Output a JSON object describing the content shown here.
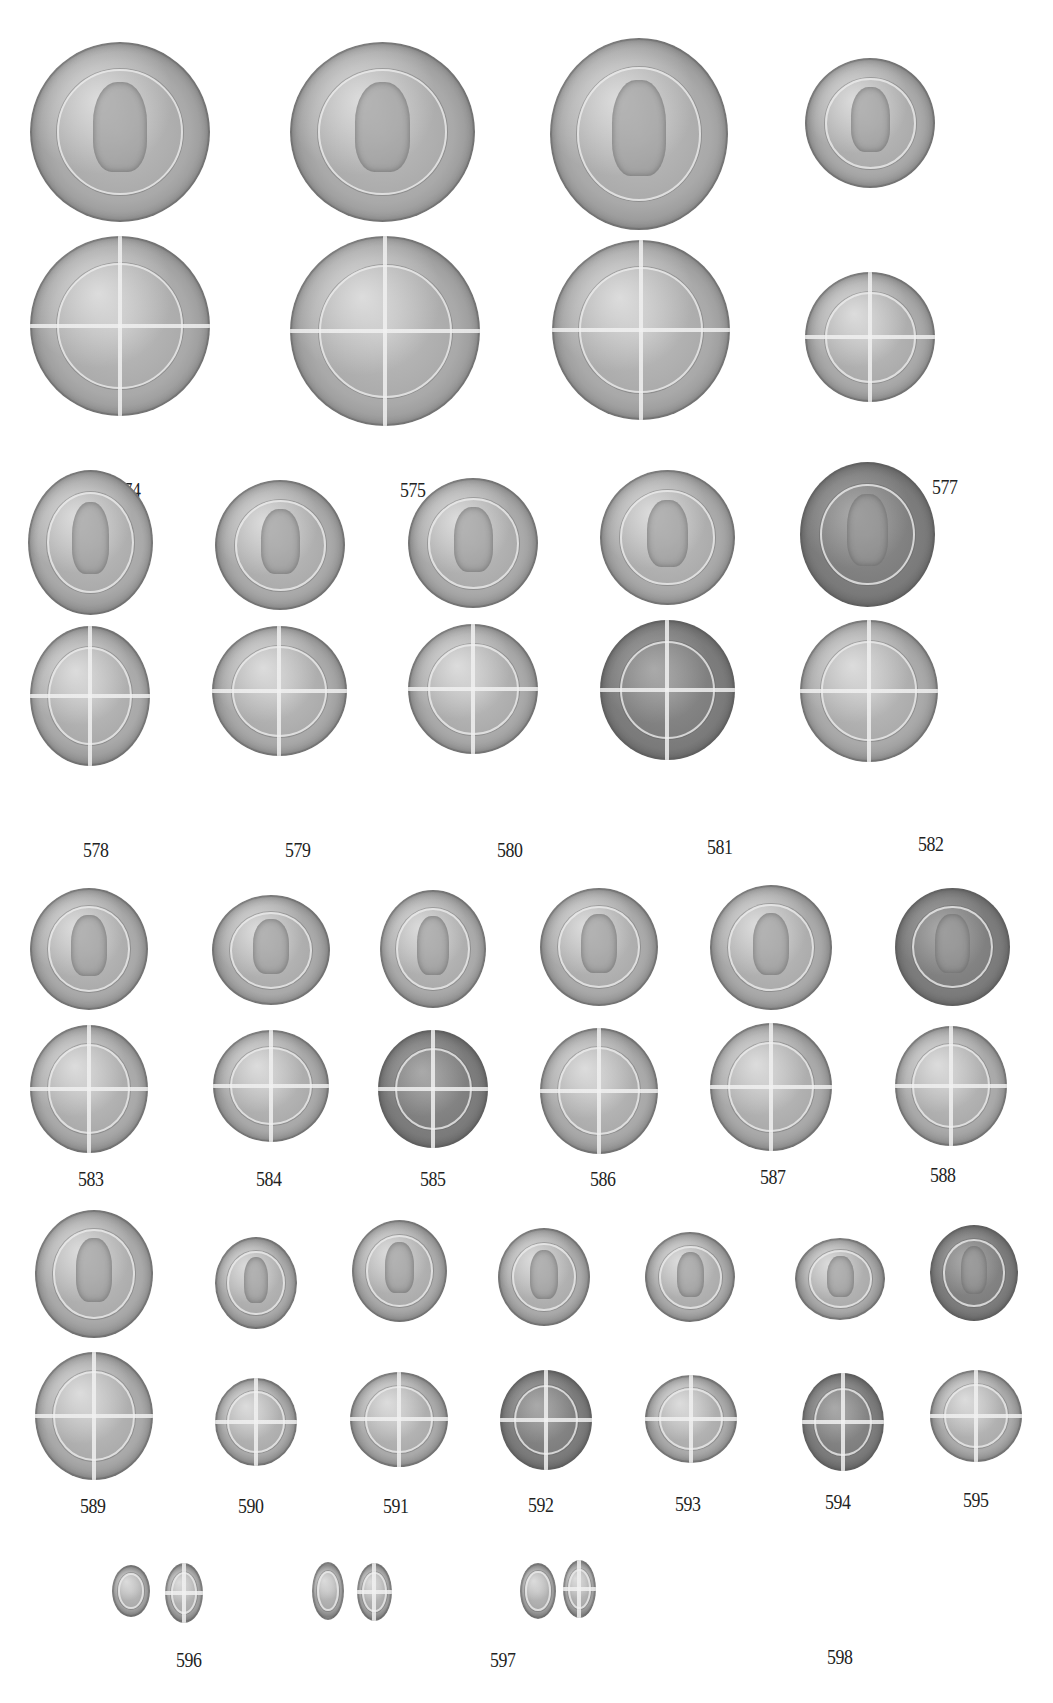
{
  "plate": {
    "background": "#ffffff",
    "label_color": "#222222",
    "rows": [
      {
        "row": 1,
        "entries": [
          {
            "number": "574",
            "sides": [
              "obverse: crowned bust right",
              "reverse: shield on long cross"
            ]
          },
          {
            "number": "575",
            "sides": [
              "obverse: crowned bust right",
              "reverse: shield on long cross"
            ]
          },
          {
            "number": "576",
            "sides": [
              "obverse: crowned bust right",
              "reverse: shield on long cross"
            ]
          },
          {
            "number": "577",
            "sides": [
              "obverse: crowned bust right",
              "reverse: shield on long cross"
            ]
          }
        ]
      },
      {
        "row": 2,
        "entries": [
          {
            "number": "578",
            "sides": [
              "obverse: crowned bust",
              "reverse: shield on long cross"
            ]
          },
          {
            "number": "579",
            "sides": [
              "obverse: crowned bust",
              "reverse: shield on long cross"
            ]
          },
          {
            "number": "580",
            "sides": [
              "obverse: crowned bust",
              "reverse: shield on long cross"
            ]
          },
          {
            "number": "581",
            "sides": [
              "obverse: crowned bust",
              "reverse: shield on long cross"
            ]
          },
          {
            "number": "582",
            "sides": [
              "obverse: crowned bust",
              "reverse: shield on long cross"
            ]
          }
        ]
      },
      {
        "row": 3,
        "entries": [
          {
            "number": "583",
            "sides": [
              "obverse: enthroned figure",
              "reverse: shield on long cross"
            ]
          },
          {
            "number": "584",
            "sides": [
              "obverse: enthroned figure",
              "reverse: shield on long cross"
            ]
          },
          {
            "number": "585",
            "sides": [
              "obverse: enthroned figure",
              "reverse: shield on long cross"
            ]
          },
          {
            "number": "586",
            "sides": [
              "obverse: enthroned figure",
              "reverse: shield on long cross"
            ]
          },
          {
            "number": "587",
            "sides": [
              "obverse: enthroned figure",
              "reverse: shield on long cross"
            ]
          },
          {
            "number": "588",
            "sides": [
              "obverse: enthroned figure",
              "reverse: shield on long cross"
            ]
          }
        ]
      },
      {
        "row": 4,
        "entries": [
          {
            "number": "589",
            "sides": [
              "obverse: enthroned figure",
              "reverse: shield on long cross"
            ]
          },
          {
            "number": "590",
            "sides": [
              "obverse: facing bust",
              "reverse: long cross with pellets"
            ]
          },
          {
            "number": "591",
            "sides": [
              "obverse: facing bust",
              "reverse: long cross with pellets"
            ]
          },
          {
            "number": "592",
            "sides": [
              "obverse: facing bust",
              "reverse: long cross with pellets"
            ]
          },
          {
            "number": "593",
            "sides": [
              "obverse: facing bust",
              "reverse: long cross with pellets"
            ]
          },
          {
            "number": "594",
            "sides": [
              "obverse: facing bust",
              "reverse: long cross with pellets"
            ]
          },
          {
            "number": "595",
            "sides": [
              "obverse: facing bust",
              "reverse: long cross with pellets"
            ]
          }
        ]
      },
      {
        "row": 5,
        "entries": [
          {
            "number": "596",
            "sides": [
              "obverse",
              "reverse"
            ]
          },
          {
            "number": "597",
            "sides": [
              "obverse: portcullis",
              "reverse: long cross"
            ]
          },
          {
            "number": "598",
            "sides": [
              "obverse",
              "reverse"
            ]
          }
        ]
      }
    ]
  }
}
